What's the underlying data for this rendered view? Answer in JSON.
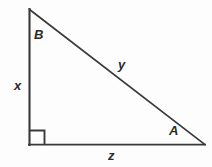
{
  "figure": {
    "kind": "right-triangle-diagram",
    "background_color": "#fdfdfd",
    "stroke_color": "#3a3a3a",
    "label_color": "#2b2b2b",
    "width": 212,
    "height": 167
  },
  "geometry": {
    "apex": {
      "x": 29,
      "y": 9
    },
    "right_angle_vertex": {
      "x": 29,
      "y": 145
    },
    "right_vertex": {
      "x": 205,
      "y": 145
    },
    "right_angle_marker_size": 15
  },
  "labels": {
    "vertex_top": "B",
    "vertex_right": "A",
    "side_left": "x",
    "side_hypotenuse": "y",
    "side_bottom": "z"
  },
  "icons": {
    "right_angle": "right-angle-marker-icon"
  }
}
